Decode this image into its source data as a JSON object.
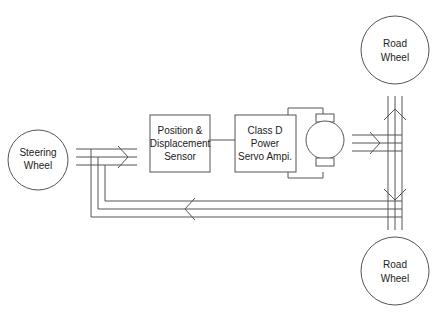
{
  "diagram": {
    "type": "block-diagram",
    "nodes": {
      "steering_wheel": {
        "line1": "Steering",
        "line2": "Wheel"
      },
      "sensor": {
        "line1": "Position &",
        "line2": "Displacement",
        "line3": "Sensor"
      },
      "amplifier": {
        "line1": "Class D",
        "line2": "Power",
        "line3": "Servo Ampi."
      },
      "road_wheel_top": {
        "line1": "Road",
        "line2": "Wheel"
      },
      "road_wheel_bottom": {
        "line1": "Road",
        "line2": "Wheel"
      },
      "motor": {
        "label": ""
      }
    },
    "colors": {
      "line": "#555555",
      "text": "#222222",
      "background": "#ffffff"
    }
  }
}
